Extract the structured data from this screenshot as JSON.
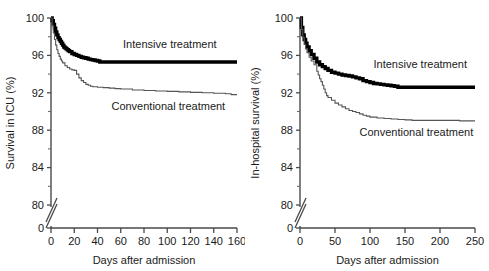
{
  "figure": {
    "panels": [
      "left",
      "right"
    ]
  },
  "chart_data": [
    {
      "id": "survival-in-icu",
      "type": "line",
      "title": "",
      "xlabel": "Days after admission",
      "ylabel": "Survival in ICU (%)",
      "xlim": [
        0,
        160
      ],
      "ylim": [
        80,
        100
      ],
      "grid": false,
      "axis_break": true,
      "axis_break_note": "y-axis broken between 0 and 80",
      "xticks": [
        0,
        20,
        40,
        60,
        80,
        100,
        120,
        140,
        160
      ],
      "xticklabels": [
        "0",
        "20",
        "40",
        "60",
        "80",
        "100",
        "120",
        "140",
        "160"
      ],
      "yticks": [
        0,
        80,
        84,
        88,
        92,
        96,
        100
      ],
      "yticklabels": [
        "0",
        "80",
        "84",
        "88",
        "92",
        "96",
        "100"
      ],
      "yticks_minor": [
        82,
        86,
        90,
        94,
        98
      ],
      "legend_position": "inline-annotations",
      "annotations": [
        {
          "text": "Intensive treatment",
          "x": 62,
          "y": 96.8
        },
        {
          "text": "Conventional treatment",
          "x": 52,
          "y": 90.2
        }
      ],
      "series": [
        {
          "name": "Intensive treatment",
          "color": "#000000",
          "style": "step-thick",
          "final_value": 95.3,
          "x": [
            0,
            1,
            2,
            3,
            4,
            5,
            6,
            7,
            8,
            9,
            10,
            11,
            12,
            13,
            14,
            15,
            16,
            18,
            20,
            22,
            24,
            26,
            28,
            30,
            32,
            34,
            36,
            38,
            40,
            42,
            160
          ],
          "y": [
            100,
            99.7,
            99.3,
            98.9,
            98.5,
            98.2,
            97.9,
            97.7,
            97.5,
            97.3,
            97.1,
            96.9,
            96.8,
            96.7,
            96.6,
            96.5,
            96.4,
            96.2,
            96.1,
            96.0,
            95.9,
            95.8,
            95.75,
            95.7,
            95.6,
            95.55,
            95.5,
            95.45,
            95.4,
            95.3,
            95.3
          ]
        },
        {
          "name": "Conventional treatment",
          "color": "#555555",
          "style": "step-thin",
          "final_value": 91.8,
          "x": [
            0,
            1,
            2,
            3,
            4,
            5,
            6,
            7,
            8,
            9,
            10,
            12,
            14,
            16,
            18,
            20,
            22,
            24,
            26,
            28,
            30,
            32,
            34,
            36,
            40,
            45,
            50,
            55,
            60,
            70,
            80,
            90,
            100,
            110,
            120,
            130,
            140,
            150,
            155,
            160
          ],
          "y": [
            100,
            99.2,
            98.4,
            97.7,
            97.1,
            96.6,
            96.2,
            95.9,
            95.6,
            95.4,
            95.2,
            94.9,
            94.7,
            94.55,
            94.45,
            94.4,
            94.0,
            93.6,
            93.3,
            93.1,
            92.9,
            92.8,
            92.7,
            92.65,
            92.6,
            92.55,
            92.5,
            92.45,
            92.4,
            92.3,
            92.25,
            92.2,
            92.15,
            92.1,
            92.05,
            92.0,
            91.95,
            91.9,
            91.8,
            91.8
          ]
        }
      ]
    },
    {
      "id": "in-hospital-survival",
      "type": "line",
      "title": "",
      "xlabel": "Days after admission",
      "ylabel": "In-hospital survival (%)",
      "xlim": [
        0,
        250
      ],
      "ylim": [
        80,
        100
      ],
      "grid": false,
      "axis_break": true,
      "axis_break_note": "y-axis broken between 0 and 80",
      "xticks": [
        0,
        50,
        100,
        150,
        200,
        250
      ],
      "xticklabels": [
        "0",
        "50",
        "100",
        "150",
        "200",
        "250"
      ],
      "yticks": [
        0,
        80,
        84,
        88,
        92,
        96,
        100
      ],
      "yticklabels": [
        "0",
        "80",
        "84",
        "88",
        "92",
        "96",
        "100"
      ],
      "yticks_minor": [
        82,
        86,
        90,
        94,
        98
      ],
      "legend_position": "inline-annotations",
      "annotations": [
        {
          "text": "Intensive treatment",
          "x": 105,
          "y": 94.6
        },
        {
          "text": "Conventional treatment",
          "x": 85,
          "y": 87.4
        }
      ],
      "series": [
        {
          "name": "Intensive treatment",
          "color": "#000000",
          "style": "step-thick",
          "final_value": 92.6,
          "x": [
            0,
            2,
            4,
            6,
            8,
            10,
            13,
            16,
            20,
            24,
            28,
            32,
            36,
            40,
            45,
            50,
            55,
            60,
            65,
            70,
            75,
            80,
            85,
            90,
            95,
            100,
            105,
            110,
            115,
            120,
            125,
            130,
            135,
            140,
            250
          ],
          "y": [
            100,
            99.0,
            98.2,
            97.7,
            97.3,
            96.9,
            96.5,
            96.1,
            95.7,
            95.3,
            95.0,
            94.8,
            94.6,
            94.4,
            94.2,
            94.1,
            94.0,
            93.9,
            93.85,
            93.8,
            93.7,
            93.6,
            93.5,
            93.3,
            93.2,
            93.1,
            93.0,
            92.95,
            92.9,
            92.85,
            92.8,
            92.75,
            92.7,
            92.6,
            92.6
          ]
        },
        {
          "name": "Conventional treatment",
          "color": "#555555",
          "style": "step-thin",
          "final_value": 89.0,
          "x": [
            0,
            2,
            4,
            6,
            8,
            10,
            13,
            16,
            20,
            24,
            26,
            28,
            30,
            32,
            34,
            36,
            38,
            40,
            45,
            50,
            55,
            60,
            65,
            70,
            75,
            80,
            85,
            90,
            95,
            100,
            110,
            120,
            130,
            140,
            150,
            160,
            170,
            180,
            190,
            200,
            210,
            220,
            228,
            240,
            250
          ],
          "y": [
            100,
            98.8,
            97.9,
            97.2,
            96.7,
            96.3,
            95.8,
            95.4,
            95.0,
            94.3,
            93.9,
            93.5,
            93.2,
            92.8,
            92.4,
            92.0,
            91.7,
            91.5,
            91.2,
            90.9,
            90.7,
            90.5,
            90.3,
            90.1,
            90.0,
            89.9,
            89.75,
            89.6,
            89.5,
            89.4,
            89.3,
            89.25,
            89.2,
            89.15,
            89.1,
            89.05,
            89.05,
            89.05,
            89.05,
            89.05,
            89.05,
            89.05,
            89.0,
            89.0,
            89.0
          ]
        }
      ]
    }
  ]
}
